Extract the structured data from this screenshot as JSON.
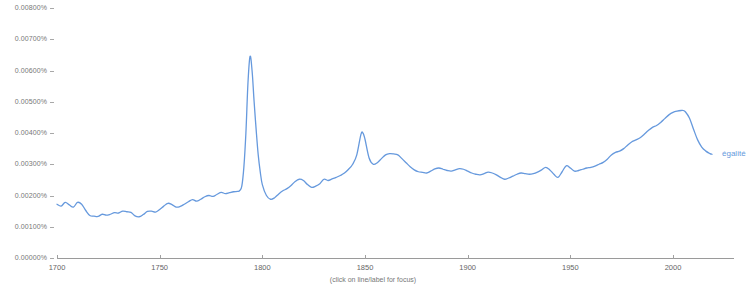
{
  "caption": "(click on line/label for focus)",
  "colors": {
    "line": "#6699dd",
    "label": "#6699dd",
    "axis": "#9a9a9a",
    "tick_text": "#777777",
    "background": "#ffffff"
  },
  "chart_data": {
    "type": "line",
    "title": "",
    "subtitle": "",
    "xlabel": "",
    "ylabel": "",
    "grid": false,
    "legend_position": "right-inline",
    "xlim": [
      1700,
      2019
    ],
    "ylim": [
      0.0,
      0.008
    ],
    "xticks": [
      1700,
      1750,
      1800,
      1850,
      1900,
      1950,
      2000
    ],
    "xticklabels": [
      "1700",
      "1750",
      "1800",
      "1850",
      "1900",
      "1950",
      "2000"
    ],
    "yticks": [
      0.0,
      0.001,
      0.002,
      0.003,
      0.004,
      0.005,
      0.006,
      0.007,
      0.008
    ],
    "yticklabels": [
      "0.00000%",
      "0.00100%",
      "0.00200%",
      "0.00300%",
      "0.00400%",
      "0.00500%",
      "0.00600%",
      "0.00700%",
      "0.00800%"
    ],
    "series": [
      {
        "name": "égalité",
        "label": "égalité",
        "color": "#6699dd",
        "x": [
          1700,
          1702,
          1704,
          1706,
          1708,
          1710,
          1712,
          1714,
          1716,
          1718,
          1720,
          1722,
          1724,
          1726,
          1728,
          1730,
          1732,
          1734,
          1736,
          1738,
          1740,
          1742,
          1744,
          1746,
          1748,
          1750,
          1752,
          1754,
          1756,
          1758,
          1760,
          1762,
          1764,
          1766,
          1768,
          1770,
          1772,
          1774,
          1776,
          1778,
          1780,
          1782,
          1784,
          1786,
          1788,
          1789,
          1790,
          1791,
          1792,
          1793,
          1794,
          1795,
          1796,
          1797,
          1798,
          1799,
          1800,
          1802,
          1804,
          1806,
          1808,
          1810,
          1812,
          1814,
          1816,
          1818,
          1820,
          1822,
          1824,
          1826,
          1828,
          1830,
          1832,
          1834,
          1836,
          1838,
          1840,
          1842,
          1844,
          1846,
          1848,
          1849,
          1850,
          1852,
          1854,
          1856,
          1858,
          1860,
          1862,
          1864,
          1866,
          1868,
          1870,
          1872,
          1874,
          1876,
          1878,
          1880,
          1882,
          1884,
          1886,
          1888,
          1890,
          1892,
          1894,
          1896,
          1898,
          1900,
          1902,
          1904,
          1906,
          1908,
          1910,
          1912,
          1914,
          1916,
          1918,
          1920,
          1922,
          1924,
          1926,
          1928,
          1930,
          1932,
          1934,
          1936,
          1938,
          1940,
          1942,
          1944,
          1946,
          1948,
          1950,
          1952,
          1954,
          1956,
          1958,
          1960,
          1962,
          1964,
          1966,
          1968,
          1970,
          1972,
          1974,
          1976,
          1978,
          1980,
          1982,
          1984,
          1986,
          1988,
          1990,
          1992,
          1994,
          1996,
          1998,
          2000,
          2002,
          2004,
          2005,
          2006,
          2008,
          2010,
          2012,
          2014,
          2016,
          2018,
          2019
        ],
        "values": [
          0.00172,
          0.00166,
          0.00178,
          0.0017,
          0.00163,
          0.00178,
          0.00172,
          0.00152,
          0.00136,
          0.00134,
          0.00133,
          0.0014,
          0.00137,
          0.0014,
          0.00145,
          0.00144,
          0.0015,
          0.00148,
          0.00146,
          0.00135,
          0.00132,
          0.00139,
          0.00149,
          0.0015,
          0.00147,
          0.00155,
          0.00166,
          0.00175,
          0.00171,
          0.00163,
          0.00165,
          0.00172,
          0.0018,
          0.00187,
          0.00182,
          0.00188,
          0.00196,
          0.002,
          0.00197,
          0.00204,
          0.0021,
          0.00206,
          0.00209,
          0.00212,
          0.00213,
          0.00216,
          0.0023,
          0.0029,
          0.004,
          0.0056,
          0.00645,
          0.006,
          0.005,
          0.0041,
          0.0033,
          0.00275,
          0.00235,
          0.002,
          0.00188,
          0.00193,
          0.00205,
          0.00215,
          0.00222,
          0.00232,
          0.00245,
          0.00252,
          0.00248,
          0.00235,
          0.00226,
          0.0023,
          0.00238,
          0.00252,
          0.00248,
          0.00253,
          0.00258,
          0.00264,
          0.00272,
          0.00284,
          0.003,
          0.0033,
          0.00395,
          0.004,
          0.0038,
          0.0032,
          0.003,
          0.00305,
          0.00318,
          0.0033,
          0.00334,
          0.00333,
          0.0033,
          0.00318,
          0.00305,
          0.00292,
          0.00282,
          0.00276,
          0.00274,
          0.00272,
          0.00278,
          0.00285,
          0.00288,
          0.00284,
          0.0028,
          0.00278,
          0.00282,
          0.00286,
          0.00284,
          0.00278,
          0.00272,
          0.00268,
          0.00266,
          0.0027,
          0.00275,
          0.00272,
          0.00266,
          0.00258,
          0.00252,
          0.00256,
          0.00262,
          0.00268,
          0.00272,
          0.0027,
          0.00268,
          0.0027,
          0.00275,
          0.00282,
          0.0029,
          0.00282,
          0.00268,
          0.00258,
          0.00276,
          0.00295,
          0.00288,
          0.00278,
          0.0028,
          0.00284,
          0.00288,
          0.0029,
          0.00294,
          0.003,
          0.00306,
          0.00316,
          0.0033,
          0.00338,
          0.00342,
          0.0035,
          0.00362,
          0.00372,
          0.00378,
          0.00385,
          0.00396,
          0.00408,
          0.00418,
          0.00424,
          0.00434,
          0.00446,
          0.00458,
          0.00466,
          0.0047,
          0.00472,
          0.00472,
          0.00468,
          0.00448,
          0.00412,
          0.00378,
          0.00355,
          0.00342,
          0.00334,
          0.00332
        ]
      }
    ]
  }
}
